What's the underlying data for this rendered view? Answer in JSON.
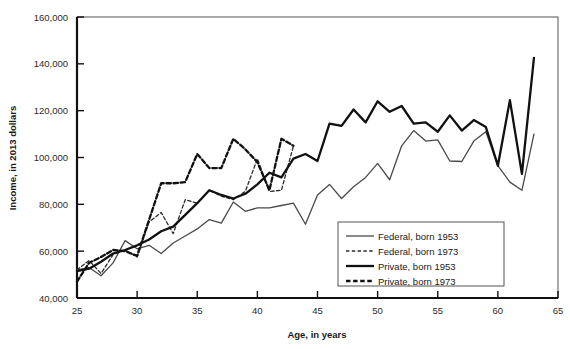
{
  "chart_data": {
    "type": "line",
    "title": "",
    "xlabel": "Age, in years",
    "ylabel": "Income, in 2013 dollars",
    "xlim": [
      25,
      65
    ],
    "ylim": [
      40000,
      160000
    ],
    "xticks": [
      25,
      30,
      35,
      40,
      45,
      50,
      55,
      60,
      65
    ],
    "yticks": [
      40000,
      60000,
      80000,
      100000,
      120000,
      140000,
      160000
    ],
    "ytick_labels": [
      "40,000",
      "60,000",
      "80,000",
      "100,000",
      "120,000",
      "140,000",
      "160,000"
    ],
    "xtick_labels": [
      "25",
      "30",
      "35",
      "40",
      "45",
      "50",
      "55",
      "60",
      "65"
    ],
    "grid": false,
    "legend_position": "lower-right",
    "series": [
      {
        "name": "Federal, born 1953",
        "style": "solid",
        "width": "thin",
        "color": "#4a4a4a",
        "x": [
          25,
          26,
          27,
          28,
          29,
          30,
          31,
          32,
          33,
          34,
          35,
          36,
          37,
          38,
          39,
          40,
          41,
          42,
          43,
          44,
          45,
          46,
          47,
          48,
          49,
          50,
          51,
          52,
          53,
          54,
          55,
          56,
          57,
          58,
          59,
          60,
          61,
          62,
          63
        ],
        "values": [
          52000,
          53000,
          49500,
          55000,
          64500,
          61000,
          62500,
          59000,
          63500,
          66500,
          69500,
          73500,
          72000,
          81000,
          77000,
          78500,
          78500,
          79500,
          80500,
          71500,
          84000,
          88500,
          82500,
          87500,
          91500,
          97500,
          90500,
          105000,
          111500,
          107000,
          107500,
          98500,
          98300,
          107000,
          111000,
          96500,
          89500,
          86000,
          110000
        ]
      },
      {
        "name": "Federal, born 1973",
        "style": "dashed",
        "width": "thin",
        "color": "#2b2b2b",
        "x": [
          25,
          26,
          27,
          28,
          29,
          30,
          31,
          32,
          33,
          34,
          35,
          36,
          37,
          38,
          39,
          40,
          41,
          42,
          43
        ],
        "values": [
          52000,
          56000,
          50500,
          58500,
          60500,
          57500,
          72500,
          76500,
          67500,
          82000,
          80500,
          86000,
          83500,
          82000,
          85500,
          99500,
          85500,
          86000,
          105000
        ]
      },
      {
        "name": "Private, born 1953",
        "style": "solid",
        "width": "thick",
        "color": "#111111",
        "x": [
          25,
          26,
          27,
          28,
          29,
          30,
          31,
          32,
          33,
          34,
          35,
          36,
          37,
          38,
          39,
          40,
          41,
          42,
          43,
          44,
          45,
          46,
          47,
          48,
          49,
          50,
          51,
          52,
          53,
          54,
          55,
          56,
          57,
          58,
          59,
          60,
          61,
          62,
          63
        ],
        "values": [
          51500,
          52500,
          55500,
          59000,
          60500,
          62500,
          65000,
          68500,
          70500,
          75500,
          80500,
          86000,
          84000,
          82500,
          84500,
          88500,
          93500,
          91500,
          99500,
          101500,
          98500,
          114500,
          113500,
          120500,
          115000,
          124000,
          119500,
          122000,
          114500,
          115000,
          111000,
          118000,
          111500,
          116000,
          113000,
          96500,
          124500,
          93000,
          142500
        ]
      },
      {
        "name": "Private, born 1973",
        "style": "dashed",
        "width": "thick",
        "color": "#111111",
        "x": [
          25,
          26,
          27,
          28,
          29,
          30,
          31,
          32,
          33,
          34,
          35,
          36,
          37,
          38,
          39,
          40,
          41,
          42,
          43
        ],
        "values": [
          47000,
          55000,
          57500,
          60500,
          60000,
          58000,
          73500,
          89000,
          89000,
          89500,
          101500,
          95500,
          95500,
          108000,
          103500,
          98000,
          86000,
          108000,
          105000
        ]
      }
    ]
  },
  "legend": {
    "items": [
      {
        "label": "Federal, born 1953"
      },
      {
        "label": "Federal, born 1973"
      },
      {
        "label": "Private, born 1953"
      },
      {
        "label": "Private, born 1973"
      }
    ]
  },
  "axes": {
    "x_title": "Age, in years",
    "y_title": "Income, in 2013 dollars"
  }
}
